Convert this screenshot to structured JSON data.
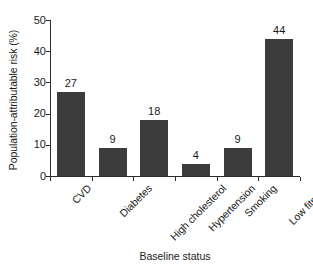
{
  "chart_data": {
    "type": "bar",
    "title": "",
    "subtitle": "",
    "xlabel": "Baseline status",
    "ylabel": "Population-attributable risk (%)",
    "categories": [
      "CVD",
      "Diabetes",
      "High cholesterol",
      "Hypertension",
      "Smoking",
      "Low fitness"
    ],
    "values": [
      27,
      9,
      18,
      4,
      9,
      44
    ],
    "value_labels": [
      "27",
      "9",
      "18",
      "4",
      "9",
      "44"
    ],
    "ylim": [
      0,
      50
    ],
    "yticks": [
      0,
      10,
      20,
      30,
      40,
      50
    ],
    "ytick_labels": [
      "0",
      "10",
      "20",
      "30",
      "40",
      "50"
    ],
    "grid": false,
    "legend": null,
    "bar_color": "#3c3c3c",
    "axis_color": "#2b2b2b",
    "background_color": "#ffffff",
    "xtick_label_rotation": -45
  }
}
